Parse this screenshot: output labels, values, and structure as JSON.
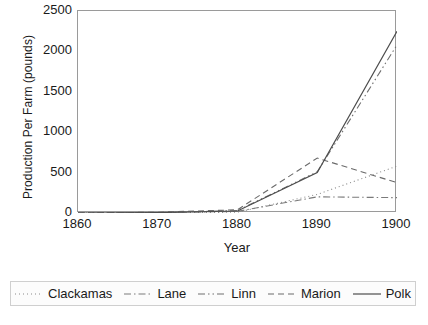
{
  "chart_data": {
    "type": "line",
    "title": "",
    "xlabel": "Year",
    "ylabel": "Production Per Farm (pounds)",
    "x": [
      1860,
      1870,
      1880,
      1890,
      1900
    ],
    "xlim": [
      1860,
      1900
    ],
    "ylim": [
      0,
      2500
    ],
    "xticks": [
      "1860",
      "1870",
      "1880",
      "1890",
      "1900"
    ],
    "yticks": [
      "0",
      "500",
      "1000",
      "1500",
      "2000",
      "2500"
    ],
    "grid": false,
    "legend_position": "bottom",
    "series": [
      {
        "name": "Clackamas",
        "values": [
          0,
          0,
          10,
          230,
          580
        ],
        "style": "dotted",
        "color": "#8a8a8a",
        "dasharray": "1,3",
        "width": 1.1
      },
      {
        "name": "Lane",
        "values": [
          0,
          5,
          20,
          200,
          190
        ],
        "style": "dash-dot",
        "color": "#7a7a7a",
        "dasharray": "7,3,1.5,3",
        "width": 1.1
      },
      {
        "name": "Linn",
        "values": [
          0,
          5,
          30,
          510,
          2080
        ],
        "style": "dash-dot-dot",
        "color": "#6e6e6e",
        "dasharray": "7,3,1.5,3,1.5,3",
        "width": 1.1
      },
      {
        "name": "Marion",
        "values": [
          0,
          10,
          40,
          680,
          375
        ],
        "style": "dashed",
        "color": "#6a6a6a",
        "dasharray": "6,4",
        "width": 1.1
      },
      {
        "name": "Polk",
        "values": [
          0,
          5,
          25,
          500,
          2250
        ],
        "style": "solid",
        "color": "#4d4d4d",
        "dasharray": "none",
        "width": 1.2
      }
    ]
  },
  "axes": {
    "y_title": "Production Per Farm (pounds)",
    "x_title": "Year",
    "y_tick_labels": [
      "2500",
      "2000",
      "1500",
      "1000",
      "500",
      "0"
    ],
    "x_tick_labels": [
      "1860",
      "1870",
      "1880",
      "1890",
      "1900"
    ]
  },
  "legend": {
    "items": [
      {
        "label": "Clackamas"
      },
      {
        "label": "Lane"
      },
      {
        "label": "Linn"
      },
      {
        "label": "Marion"
      },
      {
        "label": "Polk"
      }
    ]
  }
}
